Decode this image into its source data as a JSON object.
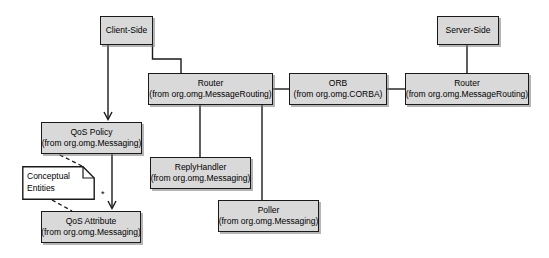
{
  "diagram": {
    "type": "uml-deployment-diagram",
    "width": 549,
    "height": 258,
    "background_color": "#ffffff",
    "node_fill_color": "#d9d9d9",
    "node_border_color": "#1a1a1a",
    "line_color": "#1a1a1a",
    "nodes": [
      {
        "id": "client-side",
        "name": "Client-Side",
        "package": "",
        "x": 100,
        "y": 16,
        "w": 53,
        "h": 29
      },
      {
        "id": "server-side",
        "name": "Server-Side",
        "package": "",
        "x": 437,
        "y": 16,
        "w": 62,
        "h": 29
      },
      {
        "id": "router-client",
        "name": "Router",
        "package": "(from org.omg.MessageRouting)",
        "x": 148,
        "y": 73,
        "w": 125,
        "h": 32
      },
      {
        "id": "orb",
        "name": "ORB",
        "package": "(from org.omg.CORBA)",
        "x": 289,
        "y": 73,
        "w": 98,
        "h": 32
      },
      {
        "id": "router-server",
        "name": "Router",
        "package": "(from org.omg.MessageRouting)",
        "x": 405,
        "y": 73,
        "w": 124,
        "h": 32
      },
      {
        "id": "qos-policy",
        "name": "QoS Policy",
        "package": "(from org.omg.Messaging)",
        "x": 41,
        "y": 122,
        "w": 101,
        "h": 32
      },
      {
        "id": "reply-handler",
        "name": "ReplyHandler",
        "package": "(from org.omg.Messaging)",
        "x": 150,
        "y": 157,
        "w": 101,
        "h": 32
      },
      {
        "id": "poller",
        "name": "Poller",
        "package": "(from org.omg.Messaging)",
        "x": 218,
        "y": 200,
        "w": 101,
        "h": 32
      },
      {
        "id": "qos-attribute",
        "name": "QoS Attribute",
        "package": "(from org.omg.Messaging)",
        "x": 41,
        "y": 211,
        "w": 100,
        "h": 32
      }
    ],
    "note": {
      "id": "conceptual-entities-note",
      "line1": "Conceptual",
      "line2": "Entities",
      "x": 22,
      "y": 166,
      "w": 73,
      "h": 34
    },
    "multiplicity_labels": [
      {
        "id": "qos-attribute-multiplicity",
        "text": "*",
        "x": 101,
        "y": 190
      }
    ],
    "edges": [
      {
        "id": "client-side-to-router-client",
        "kind": "association",
        "from": "client-side",
        "to": "router-client"
      },
      {
        "id": "client-side-to-qos-policy",
        "kind": "directed-association",
        "from": "client-side",
        "to": "qos-policy"
      },
      {
        "id": "router-client-to-orb",
        "kind": "association",
        "from": "router-client",
        "to": "orb"
      },
      {
        "id": "orb-to-router-server",
        "kind": "association",
        "from": "orb",
        "to": "router-server"
      },
      {
        "id": "server-side-to-router-server",
        "kind": "association",
        "from": "server-side",
        "to": "router-server"
      },
      {
        "id": "router-client-to-reply-handler",
        "kind": "association",
        "from": "router-client",
        "to": "reply-handler"
      },
      {
        "id": "router-client-to-poller",
        "kind": "association",
        "from": "router-client",
        "to": "poller"
      },
      {
        "id": "qos-policy-to-qos-attribute",
        "kind": "directed-association",
        "from": "qos-policy",
        "to": "qos-attribute"
      },
      {
        "id": "note-to-qos-policy",
        "kind": "anchor",
        "from": "conceptual-entities-note",
        "to": "qos-policy"
      },
      {
        "id": "note-to-qos-attribute",
        "kind": "anchor",
        "from": "conceptual-entities-note",
        "to": "qos-attribute"
      }
    ]
  }
}
